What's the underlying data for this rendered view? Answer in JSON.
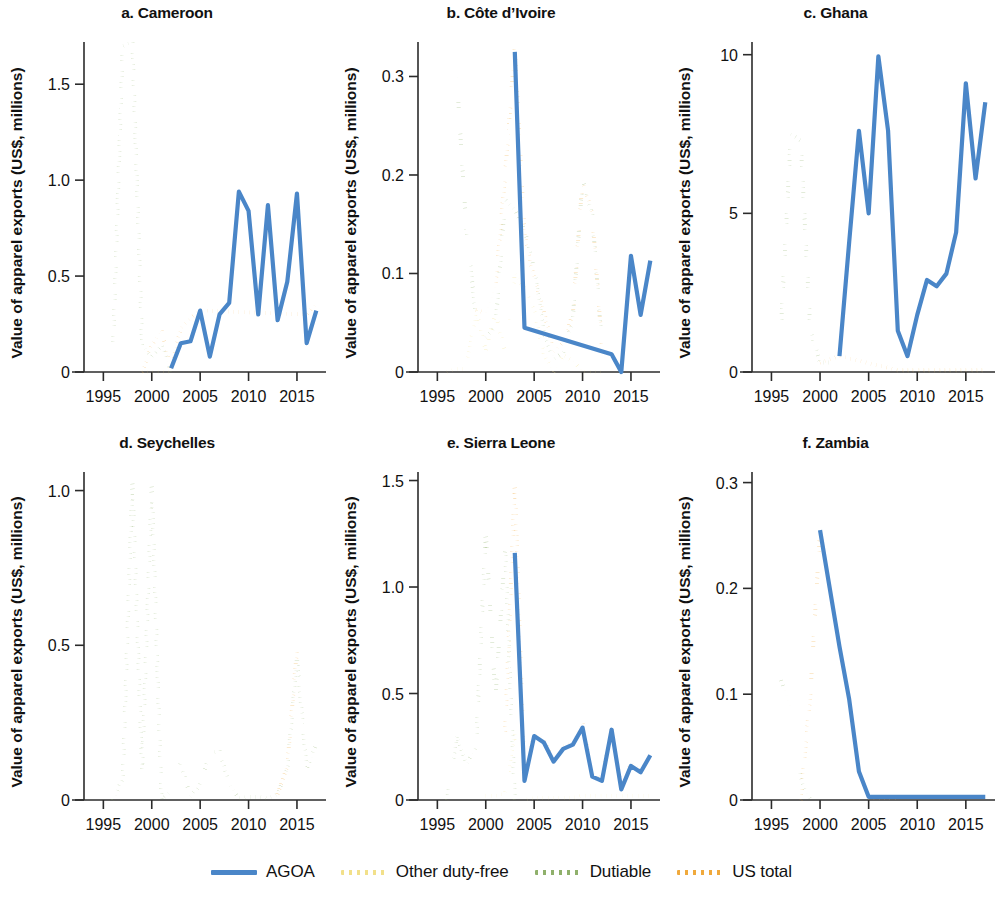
{
  "figure": {
    "y_axis_title": "Value of apparel exports (US$, millions)",
    "background": "#ffffff"
  },
  "legend": {
    "position": "bottom-center",
    "items": [
      {
        "label": "AGOA",
        "color": "#4a86c8",
        "style": "solid",
        "name": "legend-item-agoa"
      },
      {
        "label": "Other duty-free",
        "color": "#f2e08a",
        "style": "dotted",
        "name": "legend-item-other-duty-free"
      },
      {
        "label": "Dutiable",
        "color": "#8fb06b",
        "style": "dotted",
        "name": "legend-item-dutiable"
      },
      {
        "label": "US total",
        "color": "#f0a93c",
        "style": "dotted",
        "name": "legend-item-us-total"
      }
    ]
  },
  "colors": {
    "agoa": "#4a86c8",
    "other_duty_free": "#f2e08a",
    "dutiable": "#8fb06b",
    "us_total": "#f0a93c",
    "axis": "#2b2b2b",
    "text": "#111111"
  },
  "chart_data": [
    {
      "type": "line",
      "panel": "a",
      "title": "a. Cameroon",
      "xlabel": "",
      "ylabel": "Value of apparel exports (US$, millions)",
      "xlim": [
        1993,
        2018
      ],
      "ylim": [
        0,
        1.72
      ],
      "xticks": [
        1995,
        2000,
        2005,
        2010,
        2015
      ],
      "yticks": [
        0,
        0.5,
        1.0,
        1.5
      ],
      "ytick_labels": [
        "0",
        "0.5",
        "1.0",
        "1.5"
      ],
      "grid": false,
      "series": [
        {
          "name": "AGOA",
          "color": "#4a86c8",
          "style": "solid",
          "x": [
            2002,
            2003,
            2004,
            2005,
            2006,
            2007,
            2008,
            2009,
            2010,
            2011,
            2012,
            2013,
            2014,
            2015,
            2016,
            2017
          ],
          "values": [
            0.02,
            0.15,
            0.16,
            0.32,
            0.08,
            0.3,
            0.36,
            0.94,
            0.84,
            0.3,
            0.87,
            0.27,
            0.47,
            0.93,
            0.15,
            0.32
          ]
        },
        {
          "name": "Other duty-free",
          "color": "#f2e08a",
          "style": "dotted",
          "x": [
            1999,
            2000,
            2001,
            2002
          ],
          "values": [
            0.0,
            0.0,
            0.0,
            0.0
          ]
        },
        {
          "name": "Dutiable",
          "color": "#8fb06b",
          "style": "dotted",
          "x": [
            1996,
            1997,
            1998,
            1999,
            2000,
            2001,
            2002
          ],
          "values": [
            0.13,
            1.7,
            1.72,
            0.14,
            0.08,
            0.14,
            0.0
          ]
        },
        {
          "name": "US total",
          "color": "#f0a93c",
          "style": "dotted",
          "x": [
            1999,
            2000,
            2001,
            2002,
            2003,
            2004,
            2005,
            2016,
            2017
          ],
          "values": [
            0.0,
            0.14,
            0.22,
            0.01,
            0.23,
            0.28,
            0.32,
            0.3,
            0.36
          ]
        }
      ]
    },
    {
      "type": "line",
      "panel": "b",
      "title": "b. Côte d’Ivoire",
      "xlabel": "",
      "ylabel": "Value of apparel exports (US$, millions)",
      "xlim": [
        1993,
        2018
      ],
      "ylim": [
        0,
        0.335
      ],
      "xticks": [
        1995,
        2000,
        2005,
        2010,
        2015
      ],
      "yticks": [
        0,
        0.1,
        0.2,
        0.3
      ],
      "ytick_labels": [
        "0",
        "0.1",
        "0.2",
        "0.3"
      ],
      "grid": false,
      "series": [
        {
          "name": "AGOA",
          "color": "#4a86c8",
          "style": "solid",
          "x": [
            2003,
            2004,
            2013,
            2014,
            2015,
            2016,
            2017
          ],
          "values": [
            0.325,
            0.045,
            0.018,
            0.0,
            0.118,
            0.058,
            0.113
          ]
        },
        {
          "name": "Other duty-free",
          "color": "#f2e08a",
          "style": "dotted",
          "x": [
            1996,
            1997,
            1998,
            1999,
            2000,
            2001,
            2002,
            2003,
            2004,
            2005,
            2006,
            2007,
            2008,
            2009,
            2010,
            2011,
            2012
          ],
          "values": [
            0.0,
            0.003,
            0.003,
            0.063,
            0.022,
            0.06,
            0.02,
            0.1,
            0.085,
            0.062,
            0.018,
            0.0,
            0.017,
            0.012,
            0.0,
            0.0,
            0.0
          ]
        },
        {
          "name": "Dutiable",
          "color": "#8fb06b",
          "style": "dotted",
          "x": [
            1996,
            1997,
            1998,
            1999,
            2000,
            2001,
            2002,
            2003,
            2004,
            2005,
            2006,
            2007,
            2008,
            2009,
            2010,
            2011,
            2012
          ],
          "values": [
            0.28,
            0.3,
            0.145,
            0.055,
            0.035,
            0.046,
            0.175,
            0.165,
            0.145,
            0.105,
            0.04,
            0.013,
            0.02,
            0.055,
            0.196,
            0.16,
            0.026
          ]
        },
        {
          "name": "US total",
          "color": "#f0a93c",
          "style": "dotted",
          "x": [
            1999,
            2000,
            2001,
            2002,
            2003,
            2004,
            2005,
            2006,
            2007,
            2008,
            2009,
            2010,
            2011,
            2012
          ],
          "values": [
            0.063,
            0.06,
            0.088,
            0.2,
            0.33,
            0.14,
            0.095,
            0.062,
            0.02,
            0.03,
            0.06,
            0.196,
            0.16,
            0.026
          ]
        }
      ]
    },
    {
      "type": "line",
      "panel": "c",
      "title": "c. Ghana",
      "xlabel": "",
      "ylabel": "Value of apparel exports (US$, millions)",
      "xlim": [
        1993,
        2018
      ],
      "ylim": [
        0,
        10.4
      ],
      "xticks": [
        1995,
        2000,
        2005,
        2010,
        2015
      ],
      "yticks": [
        0,
        5,
        10
      ],
      "ytick_labels": [
        "0",
        "5",
        "10"
      ],
      "grid": false,
      "series": [
        {
          "name": "AGOA",
          "color": "#4a86c8",
          "style": "solid",
          "x": [
            2002,
            2003,
            2004,
            2005,
            2006,
            2007,
            2008,
            2009,
            2010,
            2011,
            2012,
            2013,
            2014,
            2015,
            2016,
            2017
          ],
          "values": [
            0.5,
            4.1,
            7.6,
            5.0,
            9.95,
            7.6,
            1.3,
            0.5,
            1.8,
            2.9,
            2.7,
            3.1,
            4.4,
            9.1,
            6.1,
            8.5
          ]
        },
        {
          "name": "Other duty-free",
          "color": "#f2e08a",
          "style": "dotted",
          "x": [
            2008,
            2009,
            2010,
            2011,
            2012,
            2013,
            2014,
            2015,
            2016,
            2017
          ],
          "values": [
            0.05,
            0.05,
            0.05,
            0.05,
            0.05,
            0.05,
            0.05,
            0.05,
            0.05,
            0.05
          ]
        },
        {
          "name": "Dutiable",
          "color": "#8fb06b",
          "style": "dotted",
          "x": [
            1996,
            1997,
            1998,
            1999,
            2000,
            2001
          ],
          "values": [
            1.5,
            7.5,
            7.3,
            1.3,
            0.3,
            0.3
          ]
        },
        {
          "name": "US total",
          "color": "#f0a93c",
          "style": "dotted",
          "x": [
            2000,
            2001,
            2002,
            2008,
            2009,
            2010,
            2011,
            2012,
            2013,
            2014,
            2015,
            2016,
            2017
          ],
          "values": [
            0.3,
            0.4,
            0.5,
            0.06,
            0.06,
            0.06,
            0.06,
            0.06,
            0.06,
            0.06,
            0.06,
            0.06,
            0.06
          ]
        }
      ]
    },
    {
      "type": "line",
      "panel": "d",
      "title": "d. Seychelles",
      "xlabel": "",
      "ylabel": "Value of apparel exports (US$, millions)",
      "xlim": [
        1993,
        2018
      ],
      "ylim": [
        0,
        1.06
      ],
      "xticks": [
        1995,
        2000,
        2005,
        2010,
        2015
      ],
      "yticks": [
        0,
        0.5,
        1.0
      ],
      "ytick_labels": [
        "0",
        "0.5",
        "1.0"
      ],
      "grid": false,
      "series": [
        {
          "name": "Dutiable",
          "color": "#8fb06b",
          "style": "dotted",
          "x": [
            1996,
            1997,
            1998,
            1999,
            2000,
            2001,
            2002,
            2003,
            2004,
            2005,
            2006,
            2007,
            2008,
            2009,
            2010,
            2011,
            2012,
            2013,
            2014,
            2015,
            2016,
            2017
          ],
          "values": [
            0.0,
            0.07,
            1.03,
            0.1,
            1.02,
            0.0,
            0.03,
            0.12,
            0.01,
            0.05,
            0.15,
            0.16,
            0.05,
            0.005,
            0.01,
            0.01,
            0.005,
            0.02,
            0.1,
            0.46,
            0.1,
            0.18
          ]
        },
        {
          "name": "US total",
          "color": "#f0a93c",
          "style": "dotted",
          "x": [
            2013,
            2014,
            2015
          ],
          "values": [
            0.02,
            0.11,
            0.49
          ]
        }
      ]
    },
    {
      "type": "line",
      "panel": "e",
      "title": "e. Sierra Leone",
      "xlabel": "",
      "ylabel": "Value of apparel exports (US$, millions)",
      "xlim": [
        1993,
        2018
      ],
      "ylim": [
        0,
        1.54
      ],
      "xticks": [
        1995,
        2000,
        2005,
        2010,
        2015
      ],
      "yticks": [
        0,
        0.5,
        1.0,
        1.5
      ],
      "ytick_labels": [
        "0",
        "0.5",
        "1.0",
        "1.5"
      ],
      "grid": false,
      "series": [
        {
          "name": "AGOA",
          "color": "#4a86c8",
          "style": "solid",
          "x": [
            2003,
            2004,
            2005,
            2006,
            2007,
            2008,
            2009,
            2010,
            2011,
            2012,
            2013,
            2014,
            2015,
            2016,
            2017
          ],
          "values": [
            1.16,
            0.09,
            0.3,
            0.27,
            0.18,
            0.24,
            0.26,
            0.34,
            0.11,
            0.09,
            0.33,
            0.05,
            0.16,
            0.13,
            0.21
          ]
        },
        {
          "name": "Other duty-free",
          "color": "#f2e08a",
          "style": "dotted",
          "x": [
            2000,
            2001,
            2002,
            2003,
            2004,
            2005,
            2006,
            2007,
            2008,
            2009,
            2010,
            2011,
            2012,
            2013,
            2014,
            2015,
            2016,
            2017
          ],
          "values": [
            0.02,
            0.02,
            0.03,
            0.32,
            0.0,
            0.01,
            0.01,
            0.01,
            0.01,
            0.01,
            0.02,
            0.02,
            0.02,
            0.02,
            0.02,
            0.02,
            0.02,
            0.02
          ]
        },
        {
          "name": "Dutiable",
          "color": "#8fb06b",
          "style": "dotted",
          "x": [
            1996,
            1997,
            1998,
            1999,
            2000,
            2001,
            2002,
            2003
          ],
          "values": [
            0.0,
            0.3,
            0.17,
            0.25,
            1.26,
            0.48,
            1.18,
            0.0
          ]
        },
        {
          "name": "US total",
          "color": "#f0a93c",
          "style": "dotted",
          "x": [
            2002,
            2003,
            2004,
            2005,
            2006,
            2007,
            2008,
            2009,
            2010,
            2011,
            2012,
            2013,
            2014,
            2015,
            2016,
            2017
          ],
          "values": [
            0.32,
            1.49,
            0.1,
            0.31,
            0.28,
            0.19,
            0.25,
            0.27,
            0.36,
            0.12,
            0.1,
            0.34,
            0.06,
            0.17,
            0.14,
            0.22
          ]
        }
      ]
    },
    {
      "type": "line",
      "panel": "f",
      "title": "f. Zambia",
      "xlabel": "",
      "ylabel": "Value of apparel exports (US$, millions)",
      "xlim": [
        1993,
        2018
      ],
      "ylim": [
        0,
        0.31
      ],
      "xticks": [
        1995,
        2000,
        2005,
        2010,
        2015
      ],
      "yticks": [
        0,
        0.1,
        0.2,
        0.3
      ],
      "ytick_labels": [
        "0",
        "0.1",
        "0.2",
        "0.3"
      ],
      "grid": false,
      "series": [
        {
          "name": "AGOA",
          "color": "#4a86c8",
          "style": "solid",
          "x": [
            2000,
            2001,
            2002,
            2003,
            2004,
            2005,
            2006,
            2007,
            2008,
            2009,
            2010,
            2011,
            2012,
            2013,
            2014,
            2015,
            2016,
            2017
          ],
          "values": [
            0.255,
            0.2,
            0.145,
            0.095,
            0.027,
            0.003,
            0.003,
            0.003,
            0.003,
            0.003,
            0.003,
            0.003,
            0.003,
            0.003,
            0.003,
            0.003,
            0.003,
            0.003
          ]
        },
        {
          "name": "Other duty-free",
          "color": "#f2e08a",
          "style": "dotted",
          "x": [
            2005,
            2006,
            2007,
            2008
          ],
          "values": [
            0.002,
            0.002,
            0.002,
            0.002
          ]
        },
        {
          "name": "Dutiable",
          "color": "#8fb06b",
          "style": "dotted",
          "x": [
            1996,
            1997,
            1998,
            1999
          ],
          "values": [
            0.113,
            0.085,
            0.02,
            0.0
          ]
        },
        {
          "name": "US total",
          "color": "#f0a93c",
          "style": "dotted",
          "x": [
            1998,
            1999,
            2000
          ],
          "values": [
            0.0,
            0.1,
            0.255
          ]
        }
      ]
    }
  ]
}
